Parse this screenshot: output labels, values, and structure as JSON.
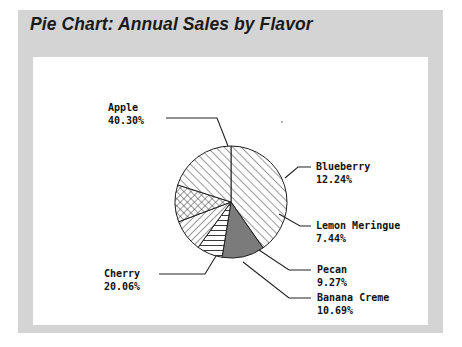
{
  "figure": {
    "title": "Pie Chart: Annual Sales by Flavor",
    "frame_color": "#d4d4d4",
    "panel_color": "#ffffff",
    "text_color": "#111111"
  },
  "chart_data": {
    "type": "pie",
    "title": "Pie Chart: Annual Sales by Flavor",
    "xlabel": "",
    "ylabel": "",
    "legend": "none",
    "labels_outside": true,
    "leader_lines": true,
    "start_angle_deg": 90,
    "direction": "clockwise",
    "categories": [
      "Apple",
      "Blueberry",
      "Lemon Meringue",
      "Pecan",
      "Banana Creme",
      "Cherry"
    ],
    "values": [
      40.3,
      12.24,
      7.44,
      9.27,
      10.69,
      20.06
    ],
    "slices": [
      {
        "name": "Apple",
        "percent_text": "40.30%",
        "value": 40.3,
        "fill": "diagonal-hatch-forward",
        "color": "#ffffff",
        "label_x": 108,
        "label_y": 108,
        "align": "left"
      },
      {
        "name": "Blueberry",
        "percent_text": "12.24%",
        "value": 12.24,
        "fill": "solid-dark-gray",
        "color": "#7b7b7b",
        "label_x": 316,
        "label_y": 160,
        "align": "left"
      },
      {
        "name": "Lemon Meringue",
        "percent_text": "7.44%",
        "value": 7.44,
        "fill": "horizontal-hatch",
        "color": "#ffffff",
        "label_x": 316,
        "label_y": 221,
        "align": "left"
      },
      {
        "name": "Pecan",
        "percent_text": "9.27%",
        "value": 9.27,
        "fill": "diagonal-hatch-backward",
        "color": "#ffffff",
        "label_x": 316,
        "label_y": 264,
        "align": "left"
      },
      {
        "name": "Banana Creme",
        "percent_text": "10.69%",
        "value": 10.69,
        "fill": "cross-hatch",
        "color": "#ffffff",
        "label_x": 316,
        "label_y": 292,
        "align": "left"
      },
      {
        "name": "Cherry",
        "percent_text": "20.06%",
        "value": 20.06,
        "fill": "diagonal-hatch-forward",
        "color": "#ffffff",
        "label_x": 104,
        "label_y": 265,
        "align": "left"
      }
    ]
  }
}
